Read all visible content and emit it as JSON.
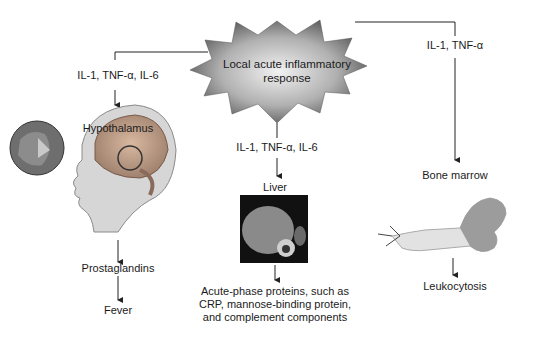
{
  "title": "Local acute inflammatory response",
  "center": {
    "line1": "Local acute inflammatory",
    "line2": "response"
  },
  "branches": [
    {
      "mediators": "IL-1, TNF-α, IL-6",
      "target": "Hypothalamus",
      "image": "brain-sagittal-illustration",
      "steps": [
        "Prostaglandins",
        "Fever"
      ]
    },
    {
      "mediators": "IL-1, TNF-α, IL-6",
      "target": "Liver",
      "image": "liver-ct-scan",
      "outcome_lines": [
        "Acute-phase proteins, such as",
        "CRP, mannose-binding protein,",
        "and complement components"
      ]
    },
    {
      "mediators": "IL-1, TNF-α",
      "target": "Bone marrow",
      "image": "femur-bone-marrow-illustration",
      "steps": [
        "Leukocytosis"
      ]
    }
  ],
  "colors": {
    "burst_dark": "#5a5a5a",
    "burst_light": "#e8e8e8",
    "line": "#222222"
  }
}
